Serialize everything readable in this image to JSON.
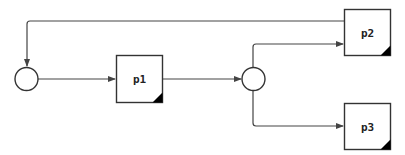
{
  "colors": {
    "stroke": "#333333",
    "edge": "#444444",
    "corner_fill": "#000000",
    "background": "#ffffff"
  },
  "nodes": {
    "start_circle": {
      "type": "circle",
      "label": ""
    },
    "p1": {
      "type": "process",
      "label": "p1"
    },
    "split_circle": {
      "type": "circle",
      "label": ""
    },
    "p2": {
      "type": "process",
      "label": "p2"
    },
    "p3": {
      "type": "process",
      "label": "p3"
    }
  },
  "edges": [
    {
      "from": "start_circle",
      "to": "p1"
    },
    {
      "from": "p1",
      "to": "split_circle"
    },
    {
      "from": "split_circle",
      "to": "p2"
    },
    {
      "from": "split_circle",
      "to": "p3"
    },
    {
      "from": "p2",
      "to": "start_circle"
    }
  ]
}
